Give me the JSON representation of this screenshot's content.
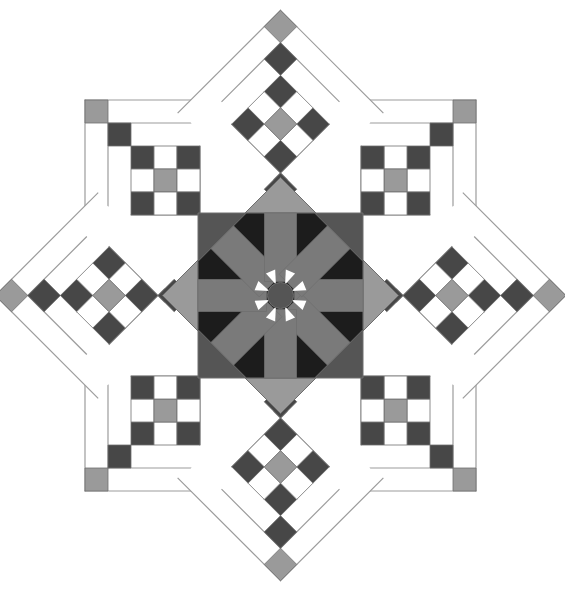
{
  "figure": {
    "title": "Eight-point star quilt block",
    "width": 565,
    "height": 593,
    "center": [
      280.5,
      295.5
    ],
    "unit": 23
  },
  "colors": {
    "background": "#ffffff",
    "light_gray": "#9a9a9a",
    "mid_gray": "#7a7a7a",
    "dark_gray": "#555555",
    "charcoal": "#474747",
    "black": "#1c1c1c",
    "white": "#ffffff",
    "outline": "#6e6e6e",
    "thin_line": "#9c9c9c"
  },
  "medallion": {
    "square_half": 82.5,
    "diamond_half": 118,
    "octagon_fill": "black",
    "spoke_fill": "mid_gray",
    "square_fill": "dark_gray",
    "diamond_fill": "light_gray",
    "center_disc_fill": "dark_gray",
    "spoke_count": 8
  },
  "arms": {
    "count": 8,
    "labels": [
      "top",
      "top-right",
      "right",
      "bottom-right",
      "bottom",
      "bottom-left",
      "left",
      "top-left"
    ],
    "nine_patch": [
      [
        "dark",
        "white",
        "dark"
      ],
      [
        "white",
        "light",
        "white"
      ],
      [
        "dark",
        "white",
        "dark"
      ]
    ],
    "chain": [
      "dark",
      "light"
    ]
  }
}
